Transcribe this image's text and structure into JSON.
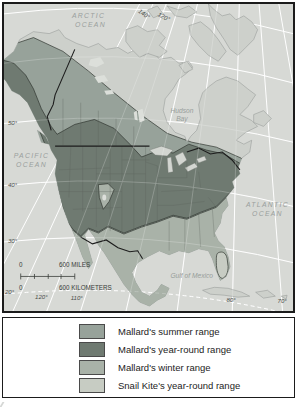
{
  "colors": {
    "summer": "#97a29a",
    "year_round": "#6f7a71",
    "winter": "#a9b2a8",
    "snail_kite": "#c7ccc3",
    "ocean": "#d7d9d5",
    "land": "#cdd0cb"
  },
  "map": {
    "ocean_labels": {
      "arctic_1": "ARCTIC",
      "arctic_2": "OCEAN",
      "pacific_1": "PACIFIC",
      "pacific_2": "OCEAN",
      "atlantic_1": "ATLANTIC",
      "atlantic_2": "OCEAN",
      "hudson_1": "Hudson",
      "hudson_2": "Bay",
      "gulf": "Gulf of Mexico"
    },
    "graticule": {
      "top": [
        "140°",
        "120°"
      ],
      "left": [
        "50°",
        "40°",
        "30°",
        "20°"
      ],
      "bottom": [
        "120°",
        "110°",
        "80°",
        "70°"
      ]
    },
    "scale": {
      "miles_zero": "0",
      "miles_label": "600 MILES",
      "km_zero": "0",
      "km_label": "600 KILOMETERS"
    }
  },
  "legend": {
    "items": [
      {
        "label": "Mallard's summer range",
        "color": "#97a29a"
      },
      {
        "label": "Mallard's year-round range",
        "color": "#6f7a71"
      },
      {
        "label": "Mallard's winter range",
        "color": "#a9b2a8"
      },
      {
        "label": "Snail Kite's year-round range",
        "color": "#c7ccc3"
      }
    ]
  }
}
